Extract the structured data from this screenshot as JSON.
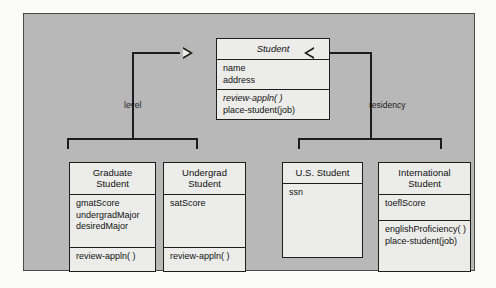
{
  "diagram": {
    "type": "uml-class-diagram",
    "classes": [
      {
        "id": "student",
        "name_line1": "Student",
        "abstract": true,
        "attributes": [
          "name",
          "address"
        ],
        "operations": [
          {
            "text": "review-appln( )",
            "abstract": true
          },
          {
            "text": "place-student(job)",
            "abstract": false
          }
        ]
      },
      {
        "id": "graduate",
        "name_line1": "Graduate",
        "name_line2": "Student",
        "abstract": false,
        "attributes": [
          "gmatScore",
          "undergradMajor",
          "desiredMajor"
        ],
        "operations": [
          {
            "text": "review-appln( )",
            "abstract": false
          }
        ]
      },
      {
        "id": "undergrad",
        "name_line1": "Undergrad",
        "name_line2": "Student",
        "abstract": false,
        "attributes": [
          "satScore"
        ],
        "operations": [
          {
            "text": "review-appln( )",
            "abstract": false
          }
        ]
      },
      {
        "id": "us_student",
        "name_line1": "U.S. Student",
        "abstract": false,
        "attributes": [
          "ssn"
        ],
        "operations": []
      },
      {
        "id": "intl_student",
        "name_line1": "International",
        "name_line2": "Student",
        "abstract": false,
        "attributes": [
          "toeflScore"
        ],
        "operations": [
          {
            "text": "englishProficiency( )",
            "abstract": false
          },
          {
            "text": "place-student(job)",
            "abstract": false
          }
        ]
      }
    ],
    "discriminators": [
      {
        "id": "level",
        "label": "level",
        "side": "left"
      },
      {
        "id": "residency",
        "label": "residency",
        "side": "right"
      }
    ],
    "generalizations": [
      {
        "from": "graduate",
        "to": "student",
        "discriminator": "level"
      },
      {
        "from": "undergrad",
        "to": "student",
        "discriminator": "level"
      },
      {
        "from": "us_student",
        "to": "student",
        "discriminator": "residency"
      },
      {
        "from": "intl_student",
        "to": "student",
        "discriminator": "residency"
      }
    ]
  },
  "colors": {
    "panel_background": "#b8b8b8",
    "class_fill": "#ececea",
    "line": "#1c1c1c",
    "page_background": "#fbfbfa"
  }
}
